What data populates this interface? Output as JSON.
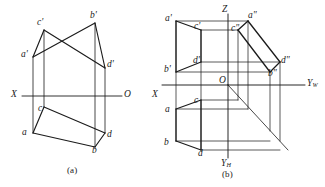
{
  "figure": {
    "type": "engineering-orthographic-projection",
    "background": "#ffffff",
    "line_color": "#1b1b1b",
    "text_color": "#1a1a1a",
    "width": 325,
    "height": 187,
    "captions": [
      {
        "id": "caption-a",
        "text": "(a)",
        "x": 67,
        "y": 166
      },
      {
        "id": "caption-b",
        "text": "(b)",
        "x": 222,
        "y": 170
      }
    ]
  },
  "diagram_a": {
    "name": "two-view-projection",
    "axis": {
      "x_label": "X",
      "o_label": "O",
      "line": {
        "x1": 22,
        "y1": 96,
        "x2": 122,
        "y2": 96
      }
    },
    "points": [
      {
        "id": "a-prime",
        "label": "a'",
        "x": 33,
        "y": 57,
        "lx": 21,
        "ly": 50
      },
      {
        "id": "c-prime",
        "label": "c'",
        "x": 44,
        "y": 30,
        "lx": 37,
        "ly": 18
      },
      {
        "id": "b-prime",
        "label": "b'",
        "x": 95,
        "y": 23,
        "lx": 90,
        "ly": 11
      },
      {
        "id": "d-prime",
        "label": "d'",
        "x": 105,
        "y": 68,
        "lx": 107,
        "ly": 60
      },
      {
        "id": "c",
        "label": "c",
        "x": 44,
        "y": 107,
        "lx": 38,
        "ly": 104
      },
      {
        "id": "a",
        "label": "a",
        "x": 33,
        "y": 133,
        "lx": 22,
        "ly": 128
      },
      {
        "id": "d",
        "label": "d",
        "x": 105,
        "y": 133,
        "lx": 107,
        "ly": 130
      },
      {
        "id": "b",
        "label": "b",
        "x": 95,
        "y": 147,
        "lx": 92,
        "ly": 146
      }
    ],
    "front_view_edges": [
      [
        "a-prime",
        "c-prime"
      ],
      [
        "c-prime",
        "d-prime"
      ],
      [
        "d-prime",
        "b-prime"
      ],
      [
        "b-prime",
        "a-prime"
      ]
    ],
    "top_view_edges": [
      [
        "c",
        "a"
      ],
      [
        "a",
        "b"
      ],
      [
        "b",
        "d"
      ],
      [
        "d",
        "c"
      ]
    ],
    "projection_lines": [
      {
        "from": "a-prime",
        "to": "a"
      },
      {
        "from": "c-prime",
        "to": "c"
      },
      {
        "from": "b-prime",
        "to": "b"
      },
      {
        "from": "d-prime",
        "to": "d"
      }
    ]
  },
  "diagram_b": {
    "name": "three-view-projection",
    "axis": {
      "x_label": "X",
      "o_label": "O",
      "z_label": "Z",
      "yw_label": "Y",
      "yw_sub": "W",
      "yh_label": "Y",
      "yh_sub": "H",
      "origin": {
        "x": 228,
        "y": 85
      },
      "x_axis": {
        "x1": 162,
        "y1": 85,
        "x2": 228,
        "y2": 85
      },
      "yw_axis": {
        "x1": 228,
        "y1": 85,
        "x2": 305,
        "y2": 85
      },
      "z_axis": {
        "x1": 228,
        "y1": 85,
        "x2": 228,
        "y2": 14
      },
      "yh_axis": {
        "x1": 228,
        "y1": 85,
        "x2": 228,
        "y2": 158
      },
      "bisector": {
        "x1": 228,
        "y1": 85,
        "x2": 288,
        "y2": 150
      }
    },
    "points": [
      {
        "id": "a-prime",
        "label": "a'",
        "x": 176,
        "y": 21,
        "lx": 165,
        "ly": 14
      },
      {
        "id": "c-prime",
        "label": "c'",
        "x": 201,
        "y": 30,
        "lx": 194,
        "ly": 22
      },
      {
        "id": "d-prime",
        "label": "d'",
        "x": 201,
        "y": 62,
        "lx": 193,
        "ly": 56
      },
      {
        "id": "b-prime",
        "label": "b'",
        "x": 176,
        "y": 72,
        "lx": 164,
        "ly": 65
      },
      {
        "id": "c",
        "label": "c",
        "x": 201,
        "y": 100,
        "lx": 194,
        "ly": 96
      },
      {
        "id": "a",
        "label": "a",
        "x": 176,
        "y": 109,
        "lx": 165,
        "ly": 105
      },
      {
        "id": "b",
        "label": "b",
        "x": 176,
        "y": 141,
        "lx": 164,
        "ly": 138
      },
      {
        "id": "d",
        "label": "d",
        "x": 201,
        "y": 150,
        "lx": 198,
        "ly": 149
      },
      {
        "id": "a-dbl",
        "label": "a\"",
        "x": 248,
        "y": 21,
        "lx": 248,
        "ly": 11
      },
      {
        "id": "c-dbl",
        "label": "c\"",
        "x": 238,
        "y": 30,
        "lx": 231,
        "ly": 24
      },
      {
        "id": "d-dbl",
        "label": "d\"",
        "x": 280,
        "y": 62,
        "lx": 281,
        "ly": 56
      },
      {
        "id": "b-dbl",
        "label": "b\"",
        "x": 270,
        "y": 72,
        "lx": 268,
        "ly": 69
      }
    ],
    "front_view_edges": [
      [
        "a-prime",
        "c-prime"
      ],
      [
        "c-prime",
        "d-prime"
      ],
      [
        "d-prime",
        "b-prime"
      ],
      [
        "b-prime",
        "a-prime"
      ]
    ],
    "top_view_edges": [
      [
        "c",
        "a"
      ],
      [
        "a",
        "b"
      ],
      [
        "b",
        "d"
      ],
      [
        "d",
        "c"
      ]
    ],
    "side_view_edges": [
      [
        "a-dbl",
        "c-dbl"
      ],
      [
        "c-dbl",
        "b-dbl"
      ],
      [
        "b-dbl",
        "d-dbl"
      ],
      [
        "d-dbl",
        "a-dbl"
      ]
    ],
    "construction_lines": [
      {
        "id": "h-a",
        "x1": 176,
        "y1": 21,
        "x2": 248,
        "y2": 21
      },
      {
        "id": "h-c",
        "x1": 201,
        "y1": 30,
        "x2": 238,
        "y2": 30
      },
      {
        "id": "h-d",
        "x1": 201,
        "y1": 62,
        "x2": 280,
        "y2": 62
      },
      {
        "id": "h-b",
        "x1": 176,
        "y1": 72,
        "x2": 270,
        "y2": 72
      },
      {
        "id": "h-c-top",
        "x1": 201,
        "y1": 100,
        "x2": 238,
        "y2": 100
      },
      {
        "id": "h-a-top",
        "x1": 176,
        "y1": 109,
        "x2": 248,
        "y2": 109
      },
      {
        "id": "v-a",
        "x1": 176,
        "y1": 21,
        "x2": 176,
        "y2": 141
      },
      {
        "id": "v-c",
        "x1": 201,
        "y1": 30,
        "x2": 201,
        "y2": 150
      },
      {
        "id": "v-cdbl",
        "x1": 238,
        "y1": 30,
        "x2": 238,
        "y2": 100
      },
      {
        "id": "v-adbl",
        "x1": 248,
        "y1": 21,
        "x2": 248,
        "y2": 109
      },
      {
        "id": "v-bdbl",
        "x1": 270,
        "y1": 72,
        "x2": 270,
        "y2": 131
      },
      {
        "id": "v-ddbl",
        "x1": 280,
        "y1": 62,
        "x2": 280,
        "y2": 141
      },
      {
        "id": "h-bot-b",
        "x1": 176,
        "y1": 141,
        "x2": 270,
        "y2": 141
      },
      {
        "id": "h-bot-d",
        "x1": 201,
        "y1": 150,
        "x2": 280,
        "y2": 150
      }
    ]
  }
}
